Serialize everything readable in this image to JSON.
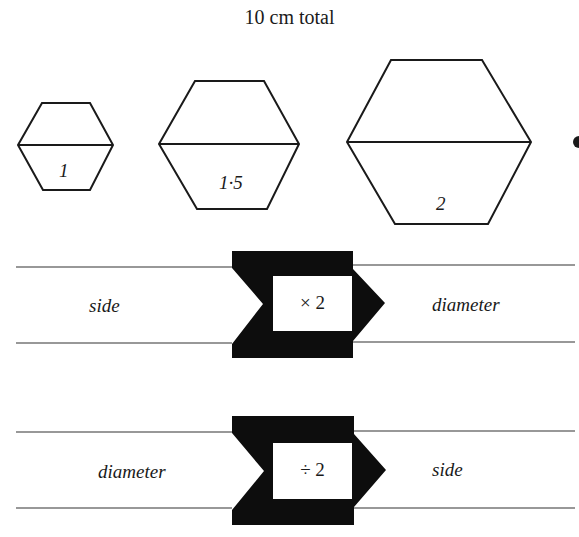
{
  "title": "10 cm total",
  "hexagons": [
    {
      "label": "1"
    },
    {
      "label": "1·5"
    },
    {
      "label": "2"
    }
  ],
  "machines": [
    {
      "input": "side",
      "operation": "× 2",
      "output": "diameter"
    },
    {
      "input": "diameter",
      "operation": "÷ 2",
      "output": "side"
    }
  ],
  "colors": {
    "ink": "#1a1a1a",
    "background": "#ffffff"
  }
}
